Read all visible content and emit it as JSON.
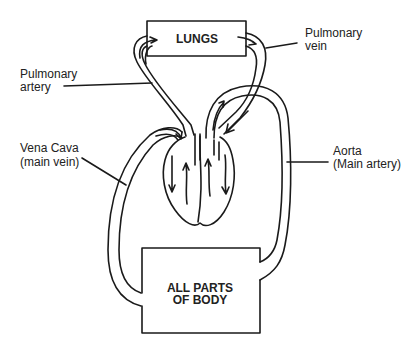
{
  "diagram": {
    "boxes": {
      "lungs": "LUNGS",
      "body_line1": "ALL PARTS",
      "body_line2": "OF BODY"
    },
    "labels": {
      "pulmonary_vein_1": "Pulmonary",
      "pulmonary_vein_2": "vein",
      "pulmonary_artery_1": "Pulmonary",
      "pulmonary_artery_2": "artery",
      "vena_cava_1": "Vena Cava",
      "vena_cava_2": "(main vein)",
      "aorta_1": "Aorta",
      "aorta_2": "(Main artery)"
    },
    "colors": {
      "stroke": "#1a1a1a",
      "background": "#ffffff"
    }
  }
}
